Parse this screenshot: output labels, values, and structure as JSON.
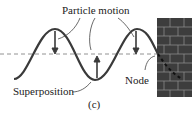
{
  "labels": {
    "particle_motion": "Particle motion",
    "superposition": "Superposition",
    "node": "Node",
    "panel": "(c)"
  },
  "colors": {
    "wave": "#3a3a3a",
    "wall": "#3d3d3d",
    "mortar": "#8a8a8a",
    "dashed": "#777777",
    "text": "#222222"
  }
}
